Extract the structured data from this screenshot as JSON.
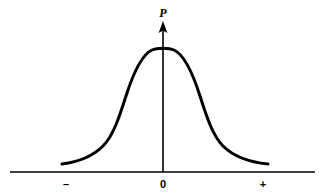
{
  "figure": {
    "name": "gaussian-probability-distribution",
    "background_color": "#ffffff",
    "stroke_color": "#000000"
  },
  "axes": {
    "y_axis_title": "P",
    "x_tick_labels": [
      {
        "text": "–",
        "name": "minus",
        "x": 66
      },
      {
        "text": "0",
        "name": "zero",
        "x": 163
      },
      {
        "text": "+",
        "name": "plus",
        "x": 263
      }
    ],
    "x_axis_y": 172,
    "x_axis_start": 10,
    "x_axis_end": 315,
    "y_axis_x": 163,
    "y_axis_top": 22,
    "arrow_head": true
  },
  "chart_data": {
    "type": "line",
    "title": "",
    "subtitle": "",
    "xlabel": "",
    "ylabel": "P",
    "grid": false,
    "legend": null,
    "annotations": [],
    "xlim": [
      -5,
      5
    ],
    "ylim": [
      0,
      1
    ],
    "x_tick_values": [
      "–",
      "0",
      "+"
    ],
    "y_tick_values": [],
    "series": [
      {
        "name": "probability-density",
        "x": [
          -5.0,
          -4.6,
          -4.2,
          -3.8,
          -3.4,
          -3.0,
          -2.6,
          -2.2,
          -1.8,
          -1.4,
          -1.0,
          -0.6,
          -0.2,
          0.0,
          0.2,
          0.6,
          1.0,
          1.4,
          1.8,
          2.2,
          2.6,
          3.0,
          3.4,
          3.8,
          4.2,
          4.6,
          5.0
        ],
        "y": [
          0.03,
          0.035,
          0.042,
          0.052,
          0.066,
          0.088,
          0.125,
          0.195,
          0.325,
          0.52,
          0.72,
          0.9,
          0.99,
          1.0,
          0.99,
          0.9,
          0.72,
          0.52,
          0.325,
          0.195,
          0.125,
          0.088,
          0.066,
          0.052,
          0.042,
          0.035,
          0.03
        ],
        "stroke_width": 3,
        "color": "#000000"
      }
    ],
    "curve_pixel_path": "M 62,164 C 78,162 92,157 103,146 C 113,136 119,118 126,96 C 133,74 141,55 152,50 C 157,47.5 169,47.5 174,50 C 185,55 193,74 200,96 C 207,118 213,136 223,146 C 234,157 248,162 268,164"
  }
}
